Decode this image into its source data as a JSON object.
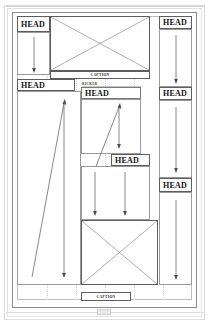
{
  "document": {
    "title": "Page layout wireframe thumbnail",
    "page_label": ""
  },
  "headlines": [
    {
      "id": "head-top-left",
      "label": "HEAD"
    },
    {
      "id": "head-top-right",
      "label": "HEAD"
    },
    {
      "id": "head-mid-left",
      "label": "HEAD"
    },
    {
      "id": "head-center",
      "label": "HEAD"
    },
    {
      "id": "head-right-second",
      "label": "HEAD"
    },
    {
      "id": "head-center-lower",
      "label": "HEAD"
    },
    {
      "id": "head-right-third",
      "label": "HEAD"
    }
  ],
  "kickers": [
    {
      "id": "kicker-center",
      "label": "KICKER"
    }
  ],
  "captions": [
    {
      "id": "caption-top",
      "label": "CAPTION"
    },
    {
      "id": "caption-bottom",
      "label": "CAPTION"
    }
  ],
  "photos": [
    {
      "id": "photo-top",
      "placeholder": "image-placeholder-x"
    },
    {
      "id": "photo-bottom",
      "placeholder": "image-placeholder-x"
    }
  ],
  "flow_arrows": [
    {
      "id": "arrow-top-left-down",
      "direction": "down"
    },
    {
      "id": "arrow-top-right-down",
      "direction": "down"
    },
    {
      "id": "arrow-left-col-up-right",
      "direction": "up-right"
    },
    {
      "id": "arrow-left-col-down",
      "direction": "down"
    },
    {
      "id": "arrow-center-up-right",
      "direction": "up-right"
    },
    {
      "id": "arrow-center-down",
      "direction": "down"
    },
    {
      "id": "arrow-center-right-down",
      "direction": "down"
    },
    {
      "id": "arrow-right-second-down",
      "direction": "down"
    },
    {
      "id": "arrow-right-third-down",
      "direction": "down"
    },
    {
      "id": "arrow-center-lower-down",
      "direction": "down"
    }
  ],
  "colors": {
    "page_border": "#8a8a8a",
    "box_stroke": "#5d5d5d",
    "guide": "#cfcfcf",
    "text": "#101010",
    "folio_fill": "#e9e9e9",
    "paper": "#ffffff"
  }
}
